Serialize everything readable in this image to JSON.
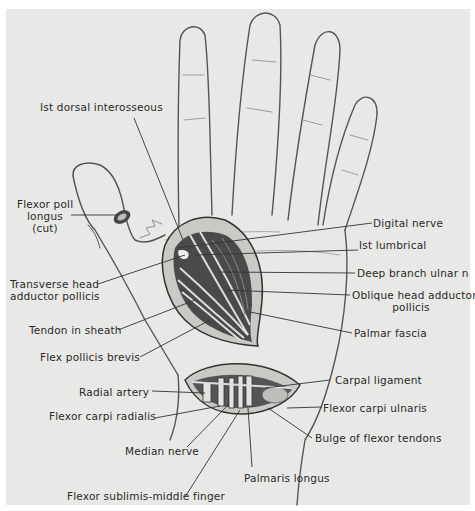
{
  "figure": {
    "background": "#e8e8e6",
    "ink": "#2a2a2a",
    "labels": {
      "dorsal_interosseous": "Ist dorsal interosseous",
      "flexor_poll_longus_1": "Flexor poll",
      "flexor_poll_longus_2": "longus",
      "flexor_poll_longus_3": "(cut)",
      "digital_nerve": "Digital nerve",
      "first_lumbrical": "Ist lumbrical",
      "deep_branch_ulnar": "Deep branch ulnar n",
      "transverse_head_1": "Transverse head",
      "transverse_head_2": "adductor pollicis",
      "oblique_head_1": "Oblique head adductor",
      "oblique_head_2": "pollicis",
      "tendon_in_sheath": "Tendon in sheath",
      "palmar_fascia": "Palmar fascia",
      "flex_pollicis_brevis": "Flex pollicis brevis",
      "radial_artery": "Radial artery",
      "carpal_ligament": "Carpal ligament",
      "flexor_carpi_radialis": "Flexor carpi radialis",
      "flexor_carpi_ulnaris": "Flexor carpi ulnaris",
      "bulge_flexor_tendons": "Bulge of flexor tendons",
      "median_nerve": "Median nerve",
      "palmaris_longus": "Palmaris longus",
      "flexor_sublimis": "Flexor sublimis-middle finger"
    }
  }
}
